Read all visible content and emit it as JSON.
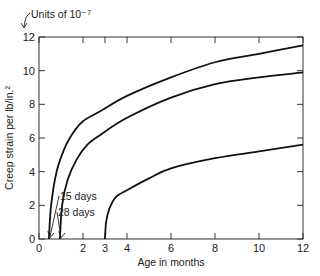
{
  "chart_data": {
    "type": "line",
    "title": "",
    "xlabel": "Age in months",
    "ylabel": "Creep strain per lb/in.²",
    "xlim": [
      0,
      12
    ],
    "ylim": [
      0,
      12
    ],
    "x_ticks": [
      0,
      2,
      3,
      4,
      6,
      8,
      10,
      12
    ],
    "y_ticks": [
      0,
      2,
      4,
      6,
      8,
      10,
      12
    ],
    "grid": false,
    "units_note": "Units of 10⁻⁷",
    "series": [
      {
        "name": "15 days",
        "x": [
          0.45,
          0.55,
          0.8,
          1.2,
          1.6,
          2.0,
          2.8,
          4,
          6,
          8,
          10,
          12
        ],
        "y": [
          0,
          2.0,
          4.0,
          5.5,
          6.4,
          7.0,
          7.6,
          8.5,
          9.6,
          10.5,
          11.0,
          11.5
        ]
      },
      {
        "name": "28 days",
        "x": [
          0.95,
          1.05,
          1.3,
          1.7,
          2.2,
          2.8,
          4,
          6,
          8,
          10,
          12
        ],
        "y": [
          0,
          2.0,
          3.5,
          4.7,
          5.6,
          6.2,
          7.2,
          8.4,
          9.2,
          9.6,
          9.9
        ]
      },
      {
        "name": "3 months",
        "x": [
          3.0,
          3.05,
          3.2,
          3.5,
          4.0,
          5,
          6,
          8,
          10,
          12
        ],
        "y": [
          0,
          1.0,
          1.8,
          2.5,
          2.9,
          3.6,
          4.2,
          4.8,
          5.2,
          5.6
        ]
      }
    ],
    "annotations": [
      {
        "text": "15 days",
        "points_to": [
          0.45,
          0
        ]
      },
      {
        "text": "28 days",
        "points_to": [
          0.95,
          0
        ]
      }
    ]
  }
}
